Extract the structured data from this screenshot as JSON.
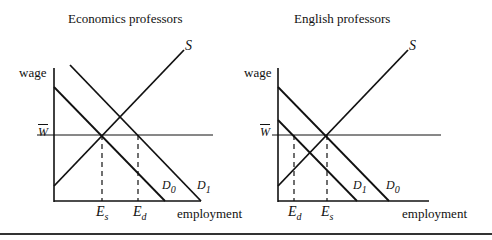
{
  "left_panel": {
    "title": "Economics professors",
    "y_axis_label": "wage",
    "x_axis_label": "employment",
    "wage_level_label": "W",
    "supply_label": "S",
    "demand_labels": [
      {
        "main": "D",
        "sub": "0"
      },
      {
        "main": "D",
        "sub": "1"
      }
    ],
    "employment_marks": [
      {
        "main": "E",
        "sub": "s"
      },
      {
        "main": "E",
        "sub": "d"
      }
    ]
  },
  "right_panel": {
    "title": "English professors",
    "y_axis_label": "wage",
    "x_axis_label": "employment",
    "wage_level_label": "W",
    "supply_label": "S",
    "demand_labels": [
      {
        "main": "D",
        "sub": "1"
      },
      {
        "main": "D",
        "sub": "0"
      }
    ],
    "employment_marks": [
      {
        "main": "E",
        "sub": "d"
      },
      {
        "main": "E",
        "sub": "s"
      }
    ]
  },
  "colors": {
    "line": "#111111",
    "rule": "#333333"
  }
}
